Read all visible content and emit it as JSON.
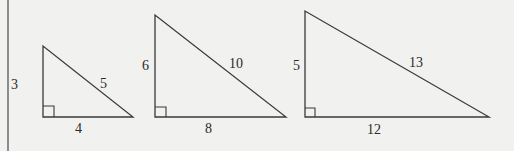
{
  "colors": {
    "background": "#f1f1ef",
    "stroke": "#3a3a3a",
    "text": "#2a2a2a"
  },
  "triangles": [
    {
      "name": "triangle-3-4-5",
      "legs": {
        "vertical": "3",
        "horizontal": "4"
      },
      "hypotenuse": "5"
    },
    {
      "name": "triangle-6-8-10",
      "legs": {
        "vertical": "6",
        "horizontal": "8"
      },
      "hypotenuse": "10"
    },
    {
      "name": "triangle-5-12-13",
      "legs": {
        "vertical": "5",
        "horizontal": "12"
      },
      "hypotenuse": "13"
    }
  ]
}
